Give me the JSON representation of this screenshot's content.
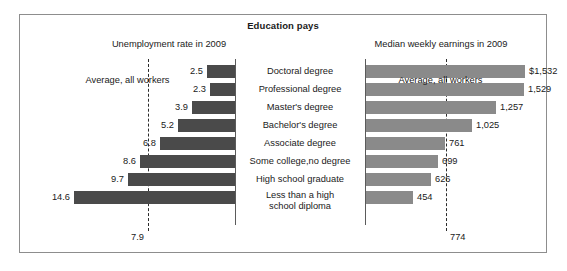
{
  "figure": {
    "title": "Education pays",
    "panels": {
      "left": {
        "heading": "Unemployment rate in 2009",
        "average_caption": "Average, all workers",
        "average_value": "7.9"
      },
      "right": {
        "heading": "Median weekly earnings in 2009",
        "average_caption": "Average, all workers",
        "average_value": "774"
      }
    },
    "colors": {
      "unemployment_bar": "#4a4a4a",
      "earnings_bar": "#8a8a8a",
      "reference_line": "#2b2b2b",
      "axis": "#5b5b5b",
      "frame": "#8d8d8d",
      "background": "#ffffff"
    }
  },
  "chart_data": {
    "type": "bar",
    "title": "Education pays",
    "orientation": "horizontal",
    "layout": "paired back-to-back panels sharing centered category labels",
    "grid": false,
    "legend": "none",
    "categories": [
      "Doctoral degree",
      "Professional degree",
      "Master's degree",
      "Bachelor's degree",
      "Associate degree",
      "Some college,no degree",
      "High school graduate",
      "Less than a high school diploma"
    ],
    "series": [
      {
        "name": "Unemployment rate in 2009",
        "unit": "percent",
        "panel": "left",
        "direction": "right-to-left",
        "values": [
          2.5,
          2.3,
          3.9,
          5.2,
          6.8,
          8.6,
          9.7,
          14.6
        ],
        "labels": [
          "2.5",
          "2.3",
          "3.9",
          "5.2",
          "6.8",
          "8.6",
          "9.7",
          "14.6"
        ],
        "reference_line": {
          "label": "Average, all workers",
          "value": 7.9,
          "value_label": "7.9"
        },
        "xlim": [
          0,
          16
        ]
      },
      {
        "name": "Median weekly earnings in 2009",
        "unit": "dollars per week",
        "panel": "right",
        "direction": "left-to-right",
        "values": [
          1532,
          1529,
          1257,
          1025,
          761,
          699,
          626,
          454
        ],
        "labels": [
          "$1,532",
          "1,529",
          "1,257",
          "1,025",
          "761",
          "699",
          "626",
          "454"
        ],
        "reference_line": {
          "label": "Average, all workers",
          "value": 774,
          "value_label": "774"
        },
        "xlim": [
          0,
          1700
        ]
      }
    ],
    "xlabel": "",
    "ylabel": ""
  }
}
